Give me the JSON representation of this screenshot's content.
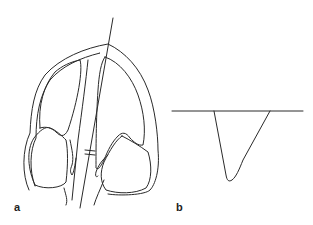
{
  "figure": {
    "panels": [
      {
        "id": "a",
        "label": "a",
        "description": "Outline cross-section with paired chambers and an oblique reference line crossing the septum (marked with a double tick)"
      },
      {
        "id": "b",
        "label": "b",
        "description": "Horizontal baseline with a downward asymmetric V-shaped trough profile"
      }
    ],
    "stroke_color": "#2a2a2a",
    "background": "#ffffff"
  }
}
